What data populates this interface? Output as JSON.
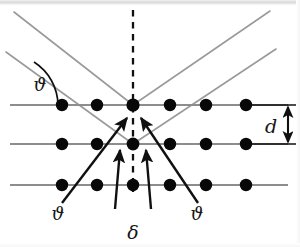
{
  "figure": {
    "type": "diagram",
    "width": 300,
    "height": 247,
    "background": "#ffffff"
  },
  "colors": {
    "lattice_line": "#8d8d8d",
    "ray_gray": "#9a9a9a",
    "ray_black": "#101010",
    "dot": "#080808",
    "dashed": "#101010",
    "label_text": "#151515"
  },
  "labels": {
    "theta_incident": "ϑ",
    "theta_left": "ϑ",
    "theta_right": "ϑ",
    "path_difference": "δ",
    "interplanar_spacing": "d"
  },
  "label_positions": {
    "theta_incident": {
      "x": 40,
      "y": 90
    },
    "theta_left": {
      "x": 58,
      "y": 219
    },
    "theta_right": {
      "x": 197,
      "y": 219
    },
    "path_difference": {
      "x": 133,
      "y": 238
    },
    "interplanar_spacing": {
      "x": 272,
      "y": 131
    }
  },
  "lattice": {
    "rows": [
      {
        "name": "top-plane",
        "y": 105,
        "x_start": 10,
        "x_end": 288,
        "dots": [
          62,
          97,
          133,
          170,
          206,
          246
        ]
      },
      {
        "name": "middle-plane",
        "y": 144,
        "x_start": 10,
        "x_end": 288,
        "dots": [
          62,
          97,
          133,
          170,
          206,
          246
        ]
      },
      {
        "name": "bottom-plane",
        "y": 185,
        "x_start": 10,
        "x_end": 288,
        "dots": [
          62,
          97,
          133,
          170,
          206,
          246
        ]
      }
    ],
    "dot_radius": 6.2,
    "spacing_label": "d"
  },
  "rays": {
    "incident_gray": [
      {
        "name": "incident-upper",
        "x1": 14,
        "y1": 12,
        "x2": 133,
        "y2": 105
      },
      {
        "name": "incident-lower",
        "x1": 8,
        "y1": 50,
        "x2": 133,
        "y2": 144
      }
    ],
    "diffracted_gray": [
      {
        "name": "diffracted-upper",
        "x1": 133,
        "y1": 105,
        "x2": 268,
        "y2": 12
      },
      {
        "name": "diffracted-lower",
        "x1": 133,
        "y1": 144,
        "x2": 272,
        "y2": 50
      }
    ],
    "incident_black": [
      {
        "name": "incident-beam-left",
        "x1": 68,
        "y1": 200,
        "x2": 128,
        "y2": 121
      },
      {
        "name": "delta-in-left",
        "x1": 118,
        "y1": 205,
        "x2": 120,
        "y2": 147
      }
    ],
    "diffracted_black": [
      {
        "name": "diffracted-beam-right",
        "x1": 192,
        "y1": 200,
        "x2": 140,
        "y2": 121
      },
      {
        "name": "delta-out-right",
        "x1": 148,
        "y1": 205,
        "x2": 146,
        "y2": 147
      }
    ],
    "center_dashed": {
      "name": "normal-line",
      "x1": 133,
      "y1": 10,
      "x2": 133,
      "y2": 192
    }
  },
  "angle_arc": {
    "name": "theta-arc",
    "cx": 8,
    "cy": 105,
    "radius": 52,
    "angle_deg": 37
  },
  "spacing_arrow": {
    "name": "d-dimension-arrow",
    "x": 288,
    "y_top": 105,
    "y_bottom": 144,
    "tick_x1": 248,
    "tick_x2": 296
  }
}
